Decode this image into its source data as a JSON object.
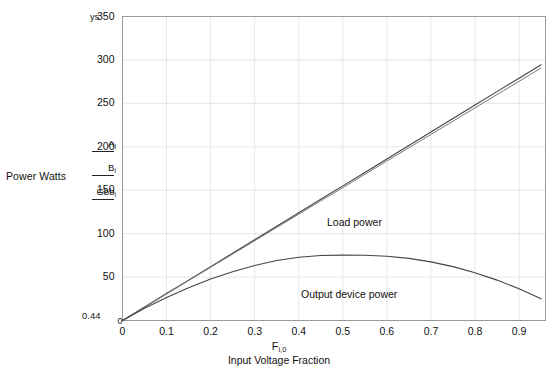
{
  "chart_data": {
    "type": "line",
    "title": "",
    "xlabel": "Input Voltage Fraction",
    "xvar": "F",
    "xvar_sub": "i,0",
    "ylabel": "Power Watts",
    "xlim": [
      0,
      0.96
    ],
    "ylim": [
      0,
      350
    ],
    "ylim_top_placeholder": "ys",
    "ylim_bottom_placeholder": "0.44",
    "grid": true,
    "legend_position": "left-outside",
    "xticks": [
      "0",
      "0.1",
      "0.2",
      "0.3",
      "0.4",
      "0.5",
      "0.6",
      "0.7",
      "0.8",
      "0.9"
    ],
    "xtick_values": [
      0,
      0.1,
      0.2,
      0.3,
      0.4,
      0.5,
      0.6,
      0.7,
      0.8,
      0.9
    ],
    "yticks": [
      "0",
      "50",
      "100",
      "150",
      "200",
      "250",
      "300",
      "350"
    ],
    "ytick_values": [
      0,
      50,
      100,
      150,
      200,
      250,
      300,
      350
    ],
    "x": [
      0,
      0.05,
      0.1,
      0.15,
      0.2,
      0.25,
      0.3,
      0.35,
      0.4,
      0.45,
      0.5,
      0.55,
      0.6,
      0.65,
      0.7,
      0.75,
      0.8,
      0.85,
      0.9,
      0.95
    ],
    "series": [
      {
        "name": "A",
        "name_sub": "i",
        "label": "Load power",
        "color": "#444444",
        "values": [
          0,
          15.5,
          31,
          46.5,
          62,
          77.5,
          93,
          108.5,
          124,
          139.5,
          155,
          170.5,
          186,
          201.5,
          217,
          232.5,
          248,
          263.5,
          279,
          294.5
        ]
      },
      {
        "name": "B",
        "name_sub": "i",
        "label": "Load power",
        "color": "#777777",
        "values": [
          0,
          15.3,
          30.6,
          45.9,
          61.2,
          76.5,
          91.8,
          107.1,
          122.4,
          137.7,
          153,
          168.3,
          183.6,
          198.9,
          214.2,
          229.5,
          244.8,
          260.1,
          275.4,
          290.7
        ]
      },
      {
        "name": "Gbb",
        "name_sub": "i",
        "label": "Output device power",
        "color": "#444444",
        "values": [
          0,
          14.0,
          26.5,
          37.8,
          47.7,
          56.2,
          63.3,
          69.0,
          72.8,
          74.8,
          75.3,
          75.2,
          74.0,
          71.5,
          67.5,
          62.0,
          55.0,
          46.5,
          36.5,
          25.0
        ]
      }
    ],
    "annotations": [
      {
        "name": "load-power",
        "text": "Load power",
        "x": 0.46,
        "y": 140
      },
      {
        "name": "output-device-power",
        "text": "Output device power",
        "x": 0.41,
        "y": 58
      }
    ]
  },
  "legend": {
    "entries": [
      {
        "name": "A",
        "sub": "i",
        "text": "A"
      },
      {
        "name": "B",
        "sub": "i",
        "text": "B"
      },
      {
        "name": "Gbb",
        "sub": "i",
        "text": "Gbb"
      }
    ]
  }
}
